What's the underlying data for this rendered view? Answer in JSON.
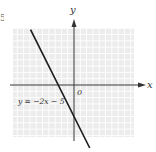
{
  "corner_fragment": "5",
  "chart_data": {
    "type": "line",
    "title": "",
    "xlabel": "x",
    "ylabel": "y",
    "origin_label": "0",
    "grid": true,
    "xlim": [
      -9.5,
      9.5
    ],
    "ylim": [
      -8.5,
      9
    ],
    "series": [
      {
        "name": "y = −2x − 5",
        "equation": {
          "slope": -2,
          "intercept": -5
        },
        "x": [
          -6.9,
          2.5
        ],
        "y": [
          8.8,
          -10
        ]
      }
    ],
    "annotations": [
      {
        "text": "y = −2x − 5",
        "near": "left of line, below x-axis"
      }
    ],
    "colors": {
      "grid_bg": "#ececec",
      "grid_line": "#ffffff",
      "axis": "#333333",
      "line": "#1a1a1a"
    }
  }
}
